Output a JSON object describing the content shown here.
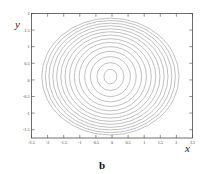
{
  "figure": {
    "caption": "b",
    "background_color": "#ffffff"
  },
  "axes": {
    "x_title": "x",
    "y_title": "y",
    "frame_color": "#4a4a4a",
    "contour_color": "#8c8c8c"
  },
  "chart_data": {
    "type": "line",
    "title": "",
    "subtitle": "",
    "xlabel": "x",
    "ylabel": "y",
    "xlim": [
      -2.5,
      2.5
    ],
    "ylim": [
      -1.75,
      2.0
    ],
    "grid": false,
    "legend": false,
    "legend_position": "none",
    "x_ticks": [
      -2.5,
      -2,
      -1.5,
      -1,
      -0.5,
      0,
      0.5,
      1,
      1.5,
      2,
      2.5
    ],
    "x_tick_labels": [
      "-2.5",
      "-2",
      "-1.5",
      "-1",
      "-0.5",
      "0",
      "0.5",
      "1",
      "1.5",
      "2",
      "2.5"
    ],
    "y_ticks": [
      -1.5,
      -1,
      -0.5,
      0,
      0.5,
      1,
      1.5,
      2
    ],
    "y_tick_labels": [
      "-1.5",
      "-1",
      "-0.5",
      "0",
      "0.5",
      "1",
      "1.5",
      "2"
    ],
    "center": [
      -0.05,
      0.1
    ],
    "contour_count": 14,
    "series": [
      {
        "name": "contour-1",
        "rx": 0.2,
        "ry": 0.22
      },
      {
        "name": "contour-2",
        "rx": 0.42,
        "ry": 0.42
      },
      {
        "name": "contour-3",
        "rx": 0.62,
        "ry": 0.6
      },
      {
        "name": "contour-4",
        "rx": 0.8,
        "ry": 0.76
      },
      {
        "name": "contour-5",
        "rx": 0.97,
        "ry": 0.9
      },
      {
        "name": "contour-6",
        "rx": 1.12,
        "ry": 1.03
      },
      {
        "name": "contour-7",
        "rx": 1.27,
        "ry": 1.14
      },
      {
        "name": "contour-8",
        "rx": 1.41,
        "ry": 1.25
      },
      {
        "name": "contour-9",
        "rx": 1.54,
        "ry": 1.35
      },
      {
        "name": "contour-10",
        "rx": 1.67,
        "ry": 1.44
      },
      {
        "name": "contour-11",
        "rx": 1.79,
        "ry": 1.53
      },
      {
        "name": "contour-12",
        "rx": 1.91,
        "ry": 1.61
      },
      {
        "name": "contour-13",
        "rx": 2.02,
        "ry": 1.69
      },
      {
        "name": "contour-14",
        "rx": 2.13,
        "ry": 1.76
      }
    ]
  }
}
